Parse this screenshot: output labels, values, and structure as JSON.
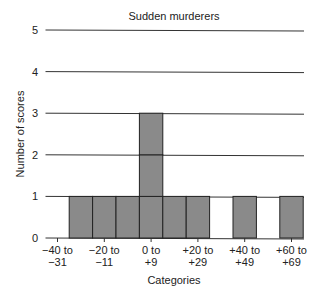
{
  "chart_data": {
    "type": "bar",
    "title": "Sudden murderers",
    "xlabel": "Categories",
    "ylabel": "Number of scores",
    "ylim": [
      0,
      5
    ],
    "yticks": [
      0,
      1,
      2,
      3,
      4,
      5
    ],
    "grid": true,
    "categories": [
      "-40 to -31",
      "-30 to -21",
      "-20 to -11",
      "-10 to -1",
      "0 to +9",
      "+10 to +19",
      "+20 to +29",
      "+30 to +39",
      "+40 to +49",
      "+50 to +59",
      "+60 to +69"
    ],
    "values": [
      0,
      1,
      1,
      1,
      3,
      1,
      1,
      0,
      1,
      0,
      1
    ],
    "xtick_labels": [
      {
        "line1": "−40 to",
        "line2": "−31"
      },
      {
        "line1": "−20 to",
        "line2": "−11"
      },
      {
        "line1": "0 to",
        "line2": "+9"
      },
      {
        "line1": "+20 to",
        "line2": "+29"
      },
      {
        "line1": "+40 to",
        "line2": "+49"
      },
      {
        "line1": "+60 to",
        "line2": "+69"
      }
    ],
    "bar_color": "#8a8a8a"
  }
}
